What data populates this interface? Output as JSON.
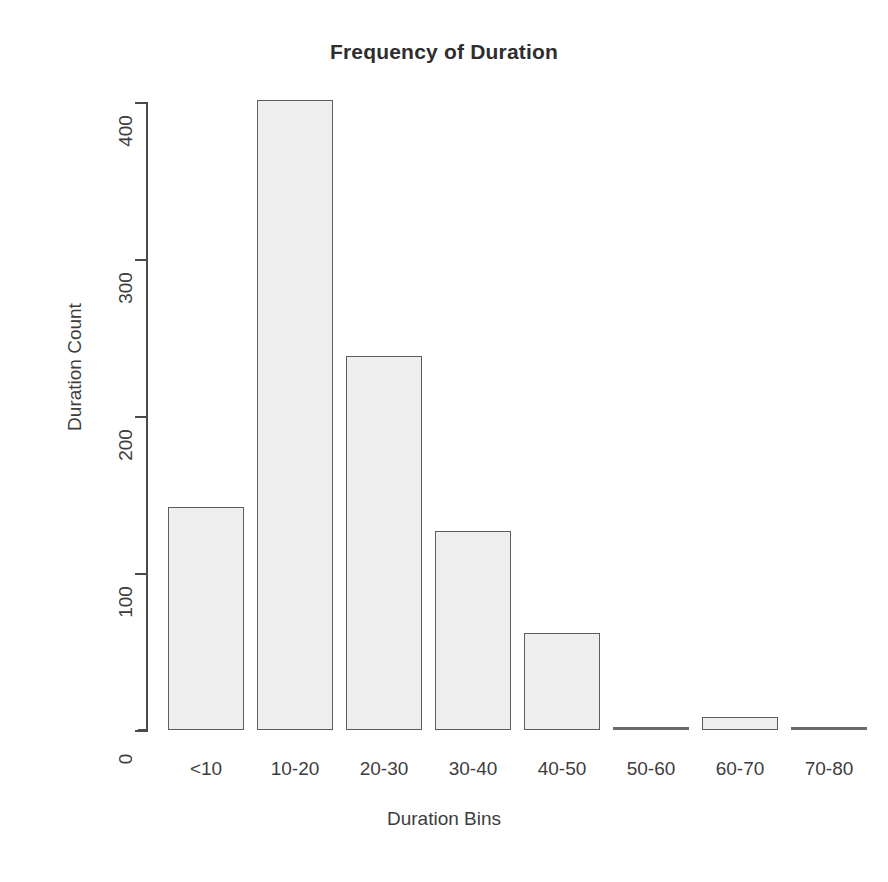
{
  "chart_data": {
    "type": "bar",
    "title": "Frequency of Duration",
    "xlabel": "Duration Bins",
    "ylabel": "Duration Count",
    "categories": [
      "<10",
      "10-20",
      "20-30",
      "30-40",
      "40-50",
      "50-60",
      "60-70",
      "70-80"
    ],
    "values": [
      142,
      401,
      238,
      127,
      62,
      2,
      8,
      1
    ],
    "ylim": [
      0,
      420
    ],
    "yticks": [
      0,
      100,
      200,
      300,
      400
    ],
    "ytick_labels": [
      "0",
      "100",
      "200",
      "300",
      "400"
    ],
    "grid": false,
    "legend": false,
    "bar_fill_color": "#eeeeee",
    "bar_border_color": "#5d5d5d",
    "axis_color": "#4a4a4a",
    "background_color": "#ffffff"
  }
}
